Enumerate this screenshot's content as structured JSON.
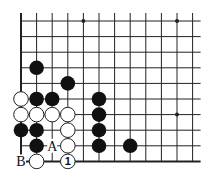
{
  "board": {
    "cols": 12,
    "rows": 10,
    "origin_x": 21,
    "origin_y": 21,
    "spacing": 15.6,
    "line_color": "#222222",
    "stone_radius": 7.3,
    "edges": {
      "left": true,
      "bottom": true,
      "top": false,
      "right": false
    },
    "hoshi": [
      [
        4,
        0
      ],
      [
        10,
        0
      ],
      [
        10,
        6
      ]
    ],
    "black_stones": [
      [
        1,
        3
      ],
      [
        3,
        4
      ],
      [
        1,
        5
      ],
      [
        2,
        5
      ],
      [
        5,
        5
      ],
      [
        5,
        6
      ],
      [
        0,
        7
      ],
      [
        1,
        7
      ],
      [
        5,
        7
      ],
      [
        1,
        8
      ],
      [
        5,
        8
      ],
      [
        7,
        8
      ]
    ],
    "white_stones": [
      [
        0,
        5
      ],
      [
        0,
        6
      ],
      [
        1,
        6
      ],
      [
        2,
        6
      ],
      [
        3,
        6
      ],
      [
        3,
        7
      ],
      [
        3,
        8
      ],
      [
        1,
        9
      ]
    ],
    "numbered_stones": [
      {
        "col": 3,
        "row": 9,
        "color": "white",
        "label": "1"
      }
    ],
    "letter_labels": [
      {
        "col": 2,
        "row": 8,
        "label": "A"
      },
      {
        "col": 0,
        "row": 9,
        "label": "B"
      }
    ]
  }
}
